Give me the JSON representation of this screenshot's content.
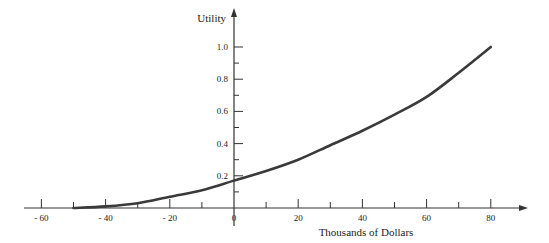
{
  "chart_data": {
    "type": "line",
    "title": "",
    "xlabel": "Thousands of Dollars",
    "ylabel": "Utility",
    "xlim": [
      -65,
      90
    ],
    "ylim": [
      0,
      1.05
    ],
    "grid": false,
    "legend": null,
    "x_ticks_major": [
      -60,
      -40,
      -20,
      0,
      20,
      40,
      60,
      80
    ],
    "x_tick_labels": [
      "- 60",
      "- 40",
      "- 20",
      "0",
      "20",
      "40",
      "60",
      "80"
    ],
    "x_ticks_minor": [
      -50,
      -30,
      -10,
      10,
      30,
      50,
      70
    ],
    "y_ticks_major": [
      0.2,
      0.4,
      0.6,
      0.8,
      1.0
    ],
    "y_tick_labels": [
      "0.2",
      "0.4",
      "0.6",
      "0.8",
      "1.0"
    ],
    "y_ticks_minor": [
      0.1,
      0.3,
      0.5,
      0.7,
      0.9
    ],
    "series": [
      {
        "name": "Utility curve",
        "x": [
          -50,
          -40,
          -30,
          -20,
          -10,
          0,
          10,
          20,
          30,
          40,
          50,
          60,
          70,
          80
        ],
        "y": [
          0.0,
          0.01,
          0.03,
          0.07,
          0.11,
          0.17,
          0.23,
          0.3,
          0.39,
          0.48,
          0.58,
          0.69,
          0.84,
          1.0
        ]
      }
    ]
  }
}
